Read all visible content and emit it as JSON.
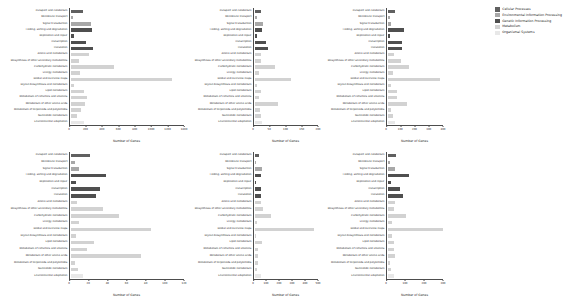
{
  "figure": {
    "xlabel": "Number of Genes"
  },
  "legend": {
    "items": [
      {
        "label": "Cellular Processes",
        "color": "#606060"
      },
      {
        "label": "Environmental Information Processing",
        "color": "#a8a8a8"
      },
      {
        "label": "Genetic Information Processing",
        "color": "#4f4f4f"
      },
      {
        "label": "Metabolism",
        "color": "#d2d2d2"
      },
      {
        "label": "Organismal Systems",
        "color": "#e8e8e8"
      }
    ]
  },
  "categories": [
    "Transport and catabolism",
    "Membrane transport",
    "Signal transduction",
    "Folding, sorting and degradation",
    "Replication and repair",
    "Transcription",
    "Translation",
    "Amino acid metabolism",
    "Biosynthesis of other secondary metabolites",
    "Carbohydrate metabolism",
    "Energy metabolism",
    "Global and overview maps",
    "Glycan biosynthesis and metabolism",
    "Lipid metabolism",
    "Metabolism of cofactors and vitamins",
    "Metabolism of other amino acids",
    "Metabolism of terpenoids and polyketides",
    "Nucleotide metabolism",
    "Environmental adaptation"
  ],
  "category_groups": [
    "Cellular Processes",
    "Environmental Information Processing",
    "Environmental Information Processing",
    "Genetic Information Processing",
    "Genetic Information Processing",
    "Genetic Information Processing",
    "Genetic Information Processing",
    "Metabolism",
    "Metabolism",
    "Metabolism",
    "Metabolism",
    "Metabolism",
    "Metabolism",
    "Metabolism",
    "Metabolism",
    "Metabolism",
    "Metabolism",
    "Metabolism",
    "Organismal Systems"
  ],
  "chart_data": [
    {
      "type": "bar",
      "id": "panel-top-left",
      "orientation": "horizontal",
      "title": "",
      "xlabel": "Number of Genes",
      "ylabel": "",
      "xlim": [
        0,
        1400
      ],
      "xticks": [
        0,
        200,
        400,
        600,
        800,
        1000,
        1200,
        1400
      ],
      "grid": false,
      "categories": [
        "Transport and catabolism",
        "Membrane transport",
        "Signal transduction",
        "Folding, sorting and degradation",
        "Replication and repair",
        "Transcription",
        "Translation",
        "Amino acid metabolism",
        "Biosynthesis of other secondary metabolites",
        "Carbohydrate metabolism",
        "Energy metabolism",
        "Global and overview maps",
        "Glycan biosynthesis and metabolism",
        "Lipid metabolism",
        "Metabolism of cofactors and vitamins",
        "Metabolism of other amino acids",
        "Metabolism of terpenoids and polyketides",
        "Nucleotide metabolism",
        "Environmental adaptation"
      ],
      "values": [
        145,
        18,
        235,
        250,
        28,
        180,
        260,
        215,
        95,
        520,
        105,
        1235,
        30,
        150,
        195,
        170,
        120,
        70,
        150
      ]
    },
    {
      "type": "bar",
      "id": "panel-top-center",
      "orientation": "horizontal",
      "title": "",
      "xlabel": "Number of Genes",
      "ylabel": "",
      "xlim": [
        0,
        200
      ],
      "xticks": [
        0,
        50,
        100,
        150,
        200
      ],
      "grid": false,
      "categories": [
        "Transport and catabolism",
        "Membrane transport",
        "Signal transduction",
        "Folding, sorting and degradation",
        "Replication and repair",
        "Transcription",
        "Translation",
        "Amino acid metabolism",
        "Biosynthesis of other secondary metabolites",
        "Carbohydrate metabolism",
        "Energy metabolism",
        "Global and overview maps",
        "Glycan biosynthesis and metabolism",
        "Lipid metabolism",
        "Metabolism of cofactors and vitamins",
        "Metabolism of other amino acids",
        "Metabolism of terpenoids and polyketides",
        "Nucleotide metabolism",
        "Environmental adaptation"
      ],
      "values": [
        18,
        4,
        25,
        22,
        6,
        32,
        38,
        16,
        18,
        62,
        12,
        110,
        6,
        16,
        10,
        72,
        14,
        16,
        20
      ]
    },
    {
      "type": "bar",
      "id": "panel-top-right",
      "orientation": "horizontal",
      "title": "",
      "xlabel": "Number of Genes",
      "ylabel": "",
      "xlim": [
        0,
        400
      ],
      "xticks": [
        0,
        100,
        200,
        300,
        400
      ],
      "grid": false,
      "categories": [
        "Transport and catabolism",
        "Membrane transport",
        "Signal transduction",
        "Folding, sorting and degradation",
        "Replication and repair",
        "Transcription",
        "Translation",
        "Amino acid metabolism",
        "Biosynthesis of other secondary metabolites",
        "Carbohydrate metabolism",
        "Energy metabolism",
        "Global and overview maps",
        "Glycan biosynthesis and metabolism",
        "Lipid metabolism",
        "Metabolism of cofactors and vitamins",
        "Metabolism of other amino acids",
        "Metabolism of terpenoids and polyketides",
        "Nucleotide metabolism",
        "Environmental adaptation"
      ],
      "values": [
        50,
        10,
        22,
        112,
        12,
        98,
        98,
        40,
        90,
        148,
        30,
        370,
        22,
        60,
        58,
        130,
        20,
        34,
        44
      ]
    },
    {
      "type": "bar",
      "id": "panel-bottom-left",
      "orientation": "horizontal",
      "title": "",
      "xlabel": "Number of Genes",
      "ylabel": "",
      "xlim": [
        0,
        120
      ],
      "xticks": [
        0,
        20,
        40,
        60,
        80,
        100,
        120
      ],
      "grid": false,
      "categories": [
        "Transport and catabolism",
        "Membrane transport",
        "Signal transduction",
        "Folding, sorting and degradation",
        "Replication and repair",
        "Transcription",
        "Translation",
        "Amino acid metabolism",
        "Biosynthesis of other secondary metabolites",
        "Carbohydrate metabolism",
        "Energy metabolism",
        "Global and overview maps",
        "Glycan biosynthesis and metabolism",
        "Lipid metabolism",
        "Metabolism of cofactors and vitamins",
        "Metabolism of other amino acids",
        "Metabolism of terpenoids and polyketides",
        "Nucleotide metabolism",
        "Environmental adaptation"
      ],
      "values": [
        20,
        4,
        8,
        36,
        5,
        30,
        26,
        6,
        33,
        50,
        8,
        84,
        5,
        24,
        16,
        73,
        4,
        7,
        12
      ]
    },
    {
      "type": "bar",
      "id": "panel-bottom-center",
      "orientation": "horizontal",
      "title": "",
      "xlabel": "Number of Genes",
      "ylabel": "",
      "xlim": [
        0,
        500
      ],
      "xticks": [
        0,
        100,
        200,
        300,
        400,
        500
      ],
      "grid": false,
      "categories": [
        "Transport and catabolism",
        "Membrane transport",
        "Signal transduction",
        "Folding, sorting and degradation",
        "Replication and repair",
        "Transcription",
        "Translation",
        "Amino acid metabolism",
        "Biosynthesis of other secondary metabolites",
        "Carbohydrate metabolism",
        "Energy metabolism",
        "Global and overview maps",
        "Glycan biosynthesis and metabolism",
        "Lipid metabolism",
        "Metabolism of cofactors and vitamins",
        "Metabolism of other amino acids",
        "Metabolism of terpenoids and polyketides",
        "Nucleotide metabolism",
        "Environmental adaptation"
      ],
      "values": [
        28,
        6,
        54,
        44,
        7,
        40,
        46,
        40,
        56,
        120,
        14,
        460,
        8,
        52,
        20,
        24,
        22,
        12,
        46
      ]
    },
    {
      "type": "bar",
      "id": "panel-bottom-right",
      "orientation": "horizontal",
      "title": "",
      "xlabel": "Number of Genes",
      "ylabel": "",
      "xlim": [
        0,
        300
      ],
      "xticks": [
        0,
        100,
        200,
        300
      ],
      "grid": false,
      "categories": [
        "Transport and catabolism",
        "Membrane transport",
        "Signal transduction",
        "Folding, sorting and degradation",
        "Replication and repair",
        "Transcription",
        "Translation",
        "Amino acid metabolism",
        "Biosynthesis of other secondary metabolites",
        "Carbohydrate metabolism",
        "Energy metabolism",
        "Global and overview maps",
        "Glycan biosynthesis and metabolism",
        "Lipid metabolism",
        "Metabolism of cofactors and vitamins",
        "Metabolism of other amino acids",
        "Metabolism of terpenoids and polyketides",
        "Nucleotide metabolism",
        "Environmental adaptation"
      ],
      "values": [
        42,
        8,
        34,
        112,
        16,
        62,
        76,
        34,
        32,
        94,
        18,
        300,
        20,
        30,
        30,
        34,
        10,
        14,
        30
      ]
    }
  ]
}
